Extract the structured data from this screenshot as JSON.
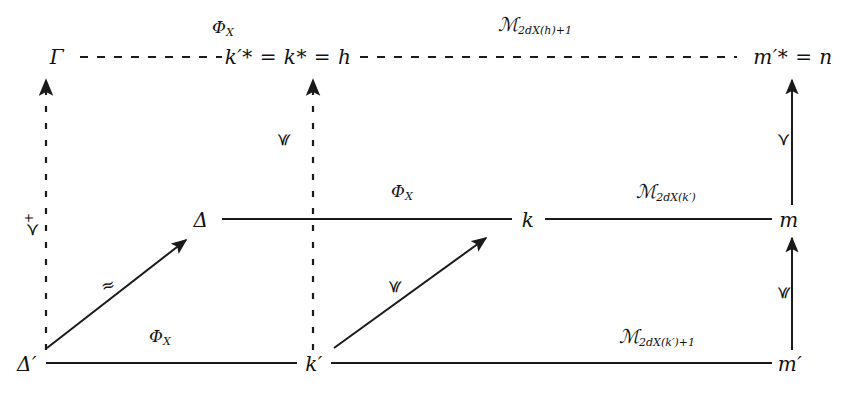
{
  "diagram": {
    "type": "commutative-diagram",
    "background_color": "#ffffff",
    "line_color": "#1a1a1a",
    "nodes": [
      {
        "id": "gamma",
        "label": "Γ",
        "x": 57,
        "y": 57,
        "row": "top",
        "col": "left"
      },
      {
        "id": "kstar",
        "label": "k′* = k* = h",
        "x": 288,
        "y": 57,
        "row": "top",
        "col": "mid"
      },
      {
        "id": "mstar",
        "label": "m′* = n",
        "x": 793,
        "y": 57,
        "row": "top",
        "col": "right"
      },
      {
        "id": "delta",
        "label": "Δ",
        "x": 201,
        "y": 220,
        "row": "middle",
        "col": "left"
      },
      {
        "id": "k",
        "label": "k",
        "x": 528,
        "y": 220,
        "row": "middle",
        "col": "mid"
      },
      {
        "id": "m",
        "label": "m",
        "x": 789,
        "y": 220,
        "row": "middle",
        "col": "right"
      },
      {
        "id": "deltaprime",
        "label": "Δ′",
        "x": 27,
        "y": 364,
        "row": "bottom",
        "col": "left"
      },
      {
        "id": "kprime",
        "label": "k′",
        "x": 314,
        "y": 364,
        "row": "bottom",
        "col": "mid"
      },
      {
        "id": "mprime",
        "label": "m′",
        "x": 790,
        "y": 364,
        "row": "bottom",
        "col": "right"
      }
    ],
    "edge_labels": [
      {
        "id": "phi-top",
        "base": "Φ",
        "sub": "X",
        "x": 223,
        "y": 28,
        "style": "dashed-row"
      },
      {
        "id": "z-top",
        "base": "ℳ",
        "sub": "2d",
        "sub_x": "X",
        "sub_rest": "(h)+1",
        "x": 535,
        "y": 25,
        "style": "dashed-row"
      },
      {
        "id": "phi-mid",
        "base": "Φ",
        "sub": "X",
        "x": 402,
        "y": 192,
        "style": "solid-row"
      },
      {
        "id": "z-mid",
        "base": "ℳ",
        "sub": "2d",
        "sub_x": "X",
        "sub_rest": "(k′)",
        "x": 666,
        "y": 192,
        "style": "solid-row"
      },
      {
        "id": "phi-bot",
        "base": "Φ",
        "sub": "X",
        "x": 160,
        "y": 337,
        "style": "solid-row"
      },
      {
        "id": "z-bot",
        "base": "ℳ",
        "sub": "2d",
        "sub_x": "X",
        "sub_rest": "(k′)+1",
        "x": 657,
        "y": 337,
        "style": "solid-row"
      }
    ],
    "relation_labels": [
      {
        "id": "rel-left-vertical",
        "text": "≺",
        "sup": "+",
        "x": 32,
        "y": 225,
        "rotation": "-90"
      },
      {
        "id": "rel-mid-vertical",
        "text": "≼",
        "sup": "",
        "x": 283,
        "y": 140,
        "rotation": "-90"
      },
      {
        "id": "rel-right-upper",
        "text": "≺",
        "sup": "",
        "x": 783,
        "y": 140,
        "rotation": "-90"
      },
      {
        "id": "rel-right-lower",
        "text": "≼",
        "sup": "",
        "x": 783,
        "y": 293,
        "rotation": "-90"
      },
      {
        "id": "rel-diag-lower-left",
        "text": "≈",
        "sup": "",
        "x": 108,
        "y": 285,
        "rotation": "-16"
      },
      {
        "id": "rel-diag-lower-mid",
        "text": "≼",
        "sup": "",
        "x": 394,
        "y": 287,
        "rotation": "-90"
      }
    ],
    "connectors": [
      {
        "id": "top-row-left-dashed",
        "kind": "horizontal",
        "dash": true,
        "arrow": false,
        "x1": 80,
        "y1": 57,
        "x2": 222,
        "y2": 57
      },
      {
        "id": "top-row-right-dashed",
        "kind": "horizontal",
        "dash": true,
        "arrow": false,
        "x1": 360,
        "y1": 57,
        "x2": 737,
        "y2": 57
      },
      {
        "id": "mid-row-left-solid",
        "kind": "horizontal",
        "dash": false,
        "arrow": false,
        "x1": 222,
        "y1": 219,
        "x2": 512,
        "y2": 219
      },
      {
        "id": "mid-row-right-solid",
        "kind": "horizontal",
        "dash": false,
        "arrow": false,
        "x1": 545,
        "y1": 219,
        "x2": 772,
        "y2": 219
      },
      {
        "id": "bot-row-left-solid",
        "kind": "horizontal",
        "dash": false,
        "arrow": false,
        "x1": 46,
        "y1": 363,
        "x2": 297,
        "y2": 363
      },
      {
        "id": "bot-row-right-solid",
        "kind": "horizontal",
        "dash": false,
        "arrow": false,
        "x1": 331,
        "y1": 363,
        "x2": 772,
        "y2": 363
      },
      {
        "id": "left-vertical-dashed",
        "kind": "vertical",
        "dash": true,
        "arrow": true,
        "x1": 46,
        "y1": 350,
        "x2": 46,
        "y2": 76
      },
      {
        "id": "mid-vertical-dashed",
        "kind": "vertical",
        "dash": true,
        "arrow": true,
        "x1": 313,
        "y1": 350,
        "x2": 313,
        "y2": 76
      },
      {
        "id": "right-vertical-upper",
        "kind": "vertical",
        "dash": false,
        "arrow": true,
        "x1": 792,
        "y1": 205,
        "x2": 792,
        "y2": 76
      },
      {
        "id": "right-vertical-lower",
        "kind": "vertical",
        "dash": false,
        "arrow": true,
        "x1": 792,
        "y1": 350,
        "x2": 792,
        "y2": 235
      },
      {
        "id": "diag-deltaprime-delta",
        "kind": "diagonal",
        "dash": false,
        "arrow": true,
        "x1": 47,
        "y1": 348,
        "x2": 188,
        "y2": 238
      },
      {
        "id": "diag-kprime-k",
        "kind": "diagonal",
        "dash": false,
        "arrow": true,
        "x1": 334,
        "y1": 348,
        "x2": 487,
        "y2": 236
      }
    ]
  }
}
